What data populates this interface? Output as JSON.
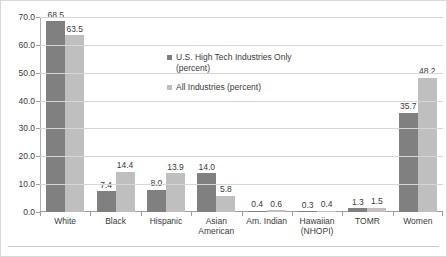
{
  "chart_data": {
    "type": "bar",
    "title": "",
    "xlabel": "",
    "ylabel": "",
    "ylim": [
      0,
      70
    ],
    "ytick_step": 10,
    "ytick_labels": [
      "70.0",
      "60.0",
      "50.0",
      "40.0",
      "30.0",
      "20.0",
      "10.0",
      "0.0"
    ],
    "grid": true,
    "legend_position": "inside-upper-center-left",
    "categories": [
      "White",
      "Black",
      "Hispanic",
      "Asian American",
      "Am. Indian",
      "Hawaiian (NHOPI)",
      "TOMR",
      "Women"
    ],
    "category_lines": [
      [
        "White"
      ],
      [
        "Black"
      ],
      [
        "Hispanic"
      ],
      [
        "Asian",
        "American"
      ],
      [
        "Am. Indian"
      ],
      [
        "Hawaiian",
        "(NHOPI)"
      ],
      [
        "TOMR"
      ],
      [
        "Women"
      ]
    ],
    "series": [
      {
        "name": "U.S. High Tech Industries Only (percent)",
        "color": "#808080",
        "values": [
          68.5,
          7.4,
          8.0,
          14.0,
          0.4,
          0.3,
          1.3,
          35.7
        ],
        "labels": [
          "68.5",
          "7.4",
          "8.0",
          "14.0",
          "0.4",
          "0.3",
          "1.3",
          "35.7"
        ]
      },
      {
        "name": "All Industries (percent)",
        "color": "#bfbfbf",
        "values": [
          63.5,
          14.4,
          13.9,
          5.8,
          0.6,
          0.4,
          1.5,
          48.2
        ],
        "labels": [
          "63.5",
          "14.4",
          "13.9",
          "5.8",
          "0.6",
          "0.4",
          "1.5",
          "48.2"
        ]
      }
    ]
  },
  "legend": {
    "entries": [
      "U.S. High Tech Industries Only\n(percent)",
      "All Industries (percent)"
    ]
  }
}
